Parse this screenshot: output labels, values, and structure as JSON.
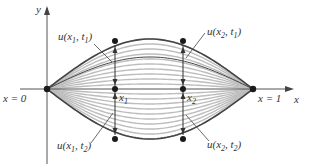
{
  "diagram": {
    "type": "vibrating-string",
    "axes": {
      "x_label": "x",
      "y_label": "y",
      "left_end_label": "x = 0",
      "right_end_label": "x = 1"
    },
    "points": {
      "x1_label": "x",
      "x1_sub": "1",
      "x2_label": "x",
      "x2_sub": "2"
    },
    "annotations": {
      "u_x1_t1": {
        "pre": "u(x",
        "sub1": "1",
        "mid": ", t",
        "sub2": "1",
        "post": ")"
      },
      "u_x2_t1": {
        "pre": "u(x",
        "sub1": "2",
        "mid": ", t",
        "sub2": "1",
        "post": ")"
      },
      "u_x1_t2": {
        "pre": "u(x",
        "sub1": "1",
        "mid": ", t",
        "sub2": "2",
        "post": ")"
      },
      "u_x2_t2": {
        "pre": "u(x",
        "sub1": "2",
        "mid": ", t",
        "sub2": "2",
        "post": ")"
      }
    },
    "colors": {
      "axis": "#555555",
      "curve_light": "#bdbdbd",
      "curve_dark": "#444444",
      "point": "#1a1a1a"
    },
    "curve_amplitudes_px": [
      50,
      45,
      40,
      35,
      30,
      25,
      20,
      15,
      10,
      5,
      -5,
      -10,
      -15,
      -20,
      -25,
      -30,
      -35,
      -40,
      -45,
      -50
    ],
    "dark_curve_amplitudes_px": [
      50,
      32,
      -50
    ]
  }
}
